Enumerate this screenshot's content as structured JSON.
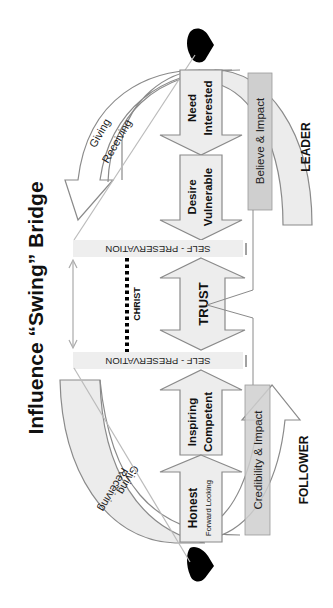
{
  "title": "Influence “Swing” Bridge",
  "orientation": "rotated 90 degrees counter-clockwise",
  "colors": {
    "stroke": "#8a8a8a",
    "fill_light": "#eeeeee",
    "fill_mid": "#cfcfcf",
    "text": "#111111",
    "heart": "#000000"
  },
  "top_side": {
    "swing_arrow": {
      "line1": "Giving",
      "line2": "Receiving"
    },
    "arrows": [
      {
        "line1": "Need",
        "line2": "Interested"
      },
      {
        "line1": "Desire",
        "line2": "Vulnerable"
      }
    ],
    "bar": "Believe & Impact",
    "role": "LEADER"
  },
  "bottom_side": {
    "swing_arrow": {
      "line1": "Giving",
      "line2": "Receiving"
    },
    "arrows": [
      {
        "line1": "Inspiring",
        "line2": "Competent"
      },
      {
        "line1": "Honest",
        "line2": "Forward Looking"
      }
    ],
    "bar": "Credibility & Impact",
    "role": "FOLLOWER"
  },
  "middle": {
    "barrier_top": "SELF - PRESERVATION",
    "barrier_bottom": "SELF - PRESERVATION",
    "center": "TRUST",
    "dotted_link": "CHRIST"
  }
}
